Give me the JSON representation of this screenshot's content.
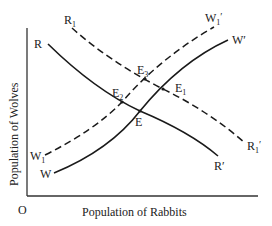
{
  "diagram": {
    "axes": {
      "origin_label": "O",
      "x_label": "Population of Rabbits",
      "y_label": "Population of Wolves"
    },
    "curves": [
      {
        "id": "R",
        "style": "solid",
        "start_label": "R",
        "end_label": "R′"
      },
      {
        "id": "R1",
        "style": "dashed",
        "start_label": "R1",
        "end_label": "R1′"
      },
      {
        "id": "W",
        "style": "solid",
        "start_label": "W",
        "end_label": "W′"
      },
      {
        "id": "W1",
        "style": "dashed",
        "start_label": "W1",
        "end_label": "W1′"
      }
    ],
    "points": {
      "E": "E",
      "E1": "E",
      "E2": "E",
      "E3": "E"
    },
    "subscripts": {
      "one": "1",
      "two": "2",
      "three": "3",
      "prime": "′"
    },
    "labels": {
      "R": "R",
      "R_end": "R′",
      "R1": "R",
      "W": "W",
      "W_end": "W′",
      "W1": "W"
    },
    "colors": {
      "line": "#1a1a1a",
      "background": "#ffffff"
    }
  }
}
